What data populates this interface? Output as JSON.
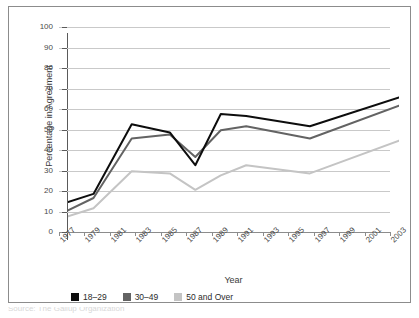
{
  "chart_data": {
    "type": "line",
    "title": "",
    "xlabel": "Year",
    "ylabel": "Percentage in Agreement",
    "ylim": [
      0,
      100
    ],
    "ytick_labels": [
      "100",
      "90",
      "80",
      "70",
      "60",
      "50",
      "40",
      "30",
      "20",
      "10",
      "0"
    ],
    "ytick_values": [
      100,
      90,
      80,
      70,
      60,
      50,
      40,
      30,
      20,
      10,
      0
    ],
    "grid": true,
    "legend_position": "bottom-left",
    "categories": [
      1977,
      1978,
      1979,
      1980,
      1981,
      1982,
      1983,
      1984,
      1985,
      1986,
      1987,
      1988,
      1989,
      1990,
      1991,
      1992,
      1993,
      1994,
      1995,
      1996,
      1997,
      1998,
      1999,
      2000,
      2001,
      2002,
      2003
    ],
    "xtick_labels": [
      "1977",
      "1979",
      "1981",
      "1983",
      "1985",
      "1987",
      "1989",
      "1991",
      "1993",
      "1995",
      "1997",
      "1999",
      "2001",
      "2003"
    ],
    "xtick_values": [
      1977,
      1979,
      1981,
      1983,
      1985,
      1987,
      1989,
      1991,
      1993,
      1995,
      1997,
      1999,
      2001,
      2003
    ],
    "series": [
      {
        "name": "18–29",
        "color": "#0d0d0d",
        "x": [
          1977,
          1979,
          1982,
          1985,
          1987,
          1989,
          1991,
          1996,
          2003
        ],
        "values": [
          18,
          22,
          56,
          52,
          36,
          61,
          60,
          55,
          69
        ]
      },
      {
        "name": "30–49",
        "color": "#636363",
        "x": [
          1977,
          1979,
          1982,
          1985,
          1987,
          1989,
          1991,
          1996,
          2003
        ],
        "values": [
          14,
          20,
          49,
          51,
          40,
          53,
          55,
          49,
          65
        ]
      },
      {
        "name": "50 and Over",
        "color": "#c4c4c4",
        "x": [
          1977,
          1979,
          1982,
          1985,
          1987,
          1989,
          1991,
          1996,
          2003
        ],
        "values": [
          11,
          15,
          33,
          32,
          24,
          31,
          36,
          32,
          48
        ]
      }
    ]
  },
  "legend": {
    "entries": [
      {
        "label": "18–29",
        "color": "#0d0d0d"
      },
      {
        "label": "30–49",
        "color": "#636363"
      },
      {
        "label": "50 and Over",
        "color": "#c4c4c4"
      }
    ]
  },
  "axes": {
    "y_title": "Percentage in Agreement",
    "x_title": "Year"
  },
  "caption": {
    "text": "Source: The Gallup Organization"
  },
  "colors": {
    "panel_border": "#8c8c8c",
    "grid": "#c9c9c9",
    "axis": "#5a5a5a",
    "text": "#3a3a3a",
    "background": "#ffffff"
  }
}
